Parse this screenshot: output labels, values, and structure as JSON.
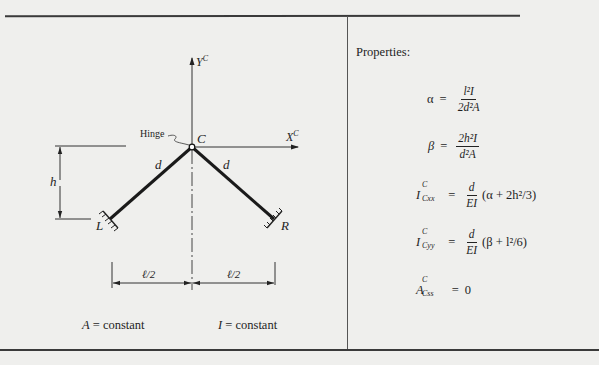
{
  "figure": {
    "labels": {
      "y_axis": "Y",
      "y_axis_sup": "C",
      "x_axis": "X",
      "x_axis_sup": "C",
      "hinge": "Hinge",
      "hinge_point": "C",
      "left_member": "d",
      "right_member": "d",
      "left_support": "L",
      "right_support": "R",
      "height": "h",
      "left_span": "ℓ/2",
      "right_span": "ℓ/2"
    },
    "notes": {
      "area": "A = constant",
      "area_symbol": "A",
      "area_text": "= constant",
      "inertia_symbol": "I",
      "inertia_text": "= constant"
    }
  },
  "properties": {
    "title": "Properties:",
    "alpha": {
      "lhs": "α",
      "eq": "=",
      "num": "l²I",
      "den": "2d²A"
    },
    "beta": {
      "lhs": "β",
      "eq": "=",
      "num": "2h²I",
      "den": "d²A"
    },
    "icxx": {
      "sym": "I",
      "sup": "C",
      "sub": "Cxx",
      "eq": "=",
      "num": "d",
      "den": "EI",
      "rest": "(α + 2h²/3)"
    },
    "icyy": {
      "sym": "I",
      "sup": "C",
      "sub": "Cyy",
      "eq": "=",
      "num": "d",
      "den": "EI",
      "rest": "(β + l²/6)"
    },
    "acss": {
      "sym": "A",
      "sup": "C",
      "sub": "Css",
      "eq": "=",
      "rest": "0"
    }
  }
}
